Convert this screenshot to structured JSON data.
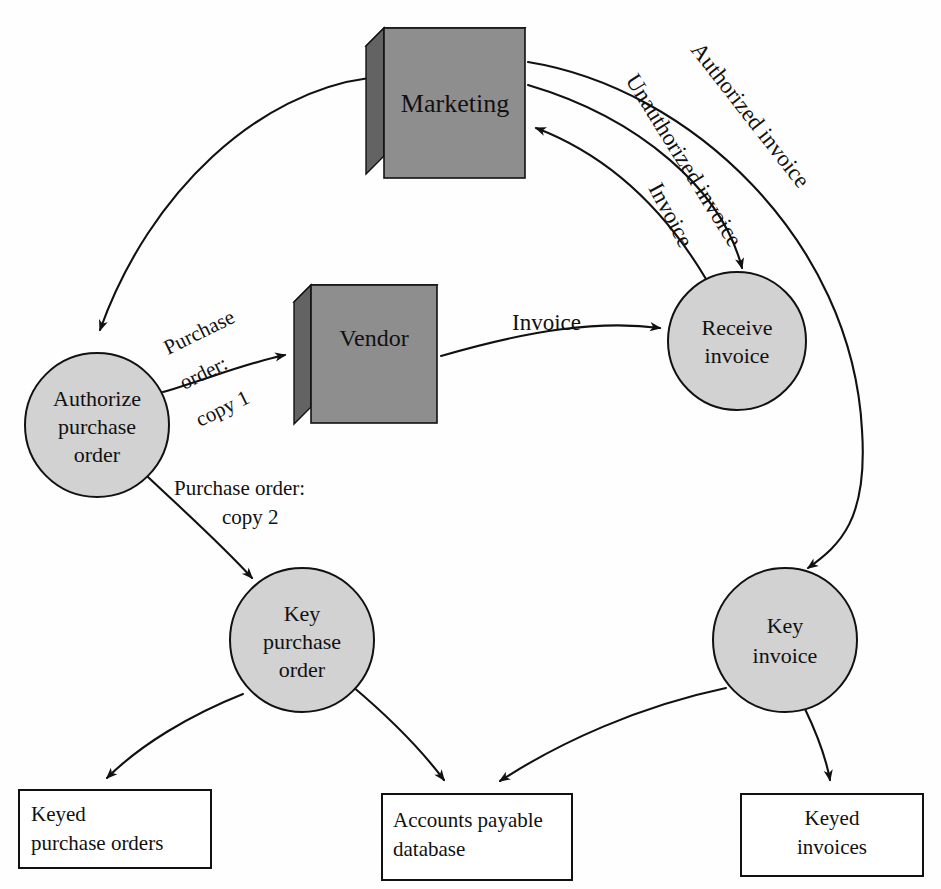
{
  "diagram": {
    "colors": {
      "external_entity_fill": "#8e8e8e",
      "external_entity_side": "#6b6b6b",
      "external_entity_top": "#7a7a7a",
      "process_fill": "#d2d2d2",
      "stroke": "#111111",
      "background": "#ffffff"
    },
    "external_entities": [
      {
        "id": "marketing",
        "label": "Marketing",
        "x": 370,
        "y": 28,
        "w": 155,
        "h": 150,
        "depth": 18
      },
      {
        "id": "vendor",
        "label": "Vendor",
        "x": 296,
        "y": 285,
        "w": 140,
        "h": 140,
        "depth": 17
      }
    ],
    "processes": [
      {
        "id": "authorize-purchase-order",
        "lines": [
          "Authorize",
          "purchase",
          "order"
        ],
        "cx": 97,
        "cy": 425,
        "r": 72
      },
      {
        "id": "receive-invoice",
        "lines": [
          "Receive",
          "invoice"
        ],
        "cx": 737,
        "cy": 341,
        "r": 69
      },
      {
        "id": "key-purchase-order",
        "lines": [
          "Key",
          "purchase",
          "order"
        ],
        "cx": 302,
        "cy": 640,
        "r": 72
      },
      {
        "id": "key-invoice",
        "lines": [
          "Key",
          "invoice"
        ],
        "cx": 785,
        "cy": 640,
        "r": 72
      }
    ],
    "data_stores": [
      {
        "id": "keyed-purchase-orders",
        "lines": [
          "Keyed",
          "purchase orders"
        ],
        "x": 19,
        "y": 790,
        "w": 192,
        "h": 78,
        "align": "left"
      },
      {
        "id": "accounts-payable-database",
        "lines": [
          "Accounts payable",
          "database"
        ],
        "x": 382,
        "y": 794,
        "w": 190,
        "h": 86,
        "align": "left"
      },
      {
        "id": "keyed-invoices",
        "lines": [
          "Keyed",
          "invoices"
        ],
        "x": 741,
        "y": 794,
        "w": 182,
        "h": 82,
        "align": "center"
      }
    ],
    "flows": [
      {
        "id": "marketing-to-authorize",
        "label": "",
        "from": "marketing",
        "to": "authorize-purchase-order"
      },
      {
        "id": "authorize-to-vendor",
        "label": "Purchase order: copy 1",
        "label_lines": [
          "Purchase",
          "order:",
          "copy 1"
        ],
        "from": "authorize-purchase-order",
        "to": "vendor"
      },
      {
        "id": "authorize-to-key-po",
        "label": "Purchase order: copy 2",
        "label_lines": [
          "Purchase order:",
          "copy 2"
        ],
        "from": "authorize-purchase-order",
        "to": "key-purchase-order"
      },
      {
        "id": "vendor-to-receive-invoice",
        "label": "Invoice",
        "from": "vendor",
        "to": "receive-invoice"
      },
      {
        "id": "receive-to-marketing",
        "label": "Invoice",
        "from": "receive-invoice",
        "to": "marketing"
      },
      {
        "id": "marketing-to-receive-unauthorized",
        "label": "Unauthorized invoice",
        "from": "marketing",
        "to": "receive-invoice"
      },
      {
        "id": "marketing-to-key-invoice-authorized",
        "label": "Authorized invoice",
        "from": "marketing",
        "to": "key-invoice"
      },
      {
        "id": "key-po-to-keyed-purchase-orders",
        "label": "",
        "from": "key-purchase-order",
        "to": "keyed-purchase-orders"
      },
      {
        "id": "key-po-to-accounts-payable",
        "label": "",
        "from": "key-purchase-order",
        "to": "accounts-payable-database"
      },
      {
        "id": "key-invoice-to-accounts-payable",
        "label": "",
        "from": "key-invoice",
        "to": "accounts-payable-database"
      },
      {
        "id": "key-invoice-to-keyed-invoices",
        "label": "",
        "from": "key-invoice",
        "to": "keyed-invoices"
      }
    ],
    "labels": {
      "marketing": "Marketing",
      "vendor": "Vendor",
      "authorized_invoice": "Authorized invoice",
      "unauthorized_invoice": "Unauthorized invoice",
      "invoice_to_marketing": "Invoice",
      "invoice_vendor_to_receive": "Invoice",
      "po_copy1_l1": "Purchase",
      "po_copy1_l2": "order:",
      "po_copy1_l3": "copy 1",
      "po_copy2_l1": "Purchase order:",
      "po_copy2_l2": "copy 2",
      "authorize_l1": "Authorize",
      "authorize_l2": "purchase",
      "authorize_l3": "order",
      "receive_l1": "Receive",
      "receive_l2": "invoice",
      "key_po_l1": "Key",
      "key_po_l2": "purchase",
      "key_po_l3": "order",
      "key_inv_l1": "Key",
      "key_inv_l2": "invoice",
      "store1_l1": "Keyed",
      "store1_l2": "purchase orders",
      "store2_l1": "Accounts payable",
      "store2_l2": "database",
      "store3_l1": "Keyed",
      "store3_l2": "invoices"
    }
  }
}
